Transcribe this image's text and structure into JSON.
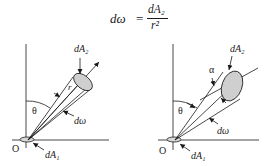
{
  "formula": {
    "lhs": "dω",
    "equals": "=",
    "numerator": "dA₂",
    "denominator": "r²"
  },
  "left_diagram": {
    "labels": {
      "area2": "dA₂",
      "radius": "r",
      "theta": "θ",
      "solid_angle": "dω",
      "origin": "O",
      "area1": "dA₁"
    }
  },
  "right_diagram": {
    "labels": {
      "area2": "dA₂",
      "alpha": "α",
      "theta": "θ",
      "solid_angle": "dω",
      "origin": "O",
      "area1": "dA₁"
    }
  },
  "colors": {
    "line": "#1a1a1a",
    "disk_fill": "#c8c8c8",
    "background": "#ffffff"
  }
}
